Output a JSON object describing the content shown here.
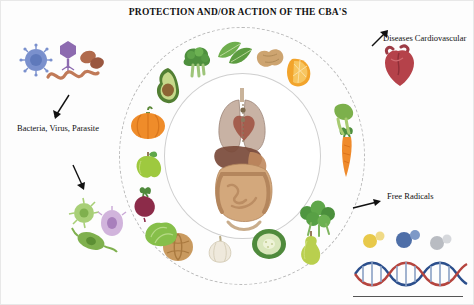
{
  "figure": {
    "title": "PROTECTION AND/OR ACTION OF THE CBA'S",
    "background_color": "#fdfdfd"
  },
  "labels": {
    "pathogens": "Bacteria, Virus, Parasite",
    "cardiovascular": "Diseases Cardiovascular",
    "free_radicals": "Free Radicals"
  },
  "rings": {
    "outer_style": "dashed-circle",
    "inner_style": "solid-circle",
    "outer_color": "#b9b9b9",
    "inner_color": "#cfcfcf"
  },
  "center": {
    "name": "human-torso-organs",
    "description": "Human torso anatomy with lungs, heart, liver, stomach and intestines"
  },
  "foods_ring": [
    {
      "name": "broccoli",
      "color": "#5f9f4a"
    },
    {
      "name": "spinach-leaves",
      "color": "#6fae4e"
    },
    {
      "name": "ginger-root",
      "color": "#cfa86b"
    },
    {
      "name": "orange-slice",
      "color": "#f0a62c"
    },
    {
      "name": "carrot",
      "color": "#ef8a2b"
    },
    {
      "name": "celery-stalk",
      "color": "#86b454"
    },
    {
      "name": "parsley-bunch",
      "color": "#5ea049"
    },
    {
      "name": "zucchini",
      "color": "#7fae53"
    },
    {
      "name": "pear",
      "color": "#b9cf5a"
    },
    {
      "name": "garlic-bulb",
      "color": "#e8e3d2"
    },
    {
      "name": "walnut",
      "color": "#c49a63"
    },
    {
      "name": "lettuce",
      "color": "#8fc05a"
    },
    {
      "name": "beetroot",
      "color": "#8e2b48"
    },
    {
      "name": "green-apple",
      "color": "#9ec93f"
    },
    {
      "name": "pumpkin",
      "color": "#ef8c2a"
    },
    {
      "name": "avocado",
      "color": "#6f9c3f"
    }
  ],
  "pathogens_group": [
    {
      "name": "virus-particle",
      "color": "#6f86c9"
    },
    {
      "name": "bacteriophage",
      "color": "#8d6bb0"
    },
    {
      "name": "spirochete-bacterium",
      "color": "#c06a4e"
    },
    {
      "name": "rod-bacterium",
      "color": "#a85a42"
    },
    {
      "name": "amoeba-parasite",
      "color": "#9ec96a"
    },
    {
      "name": "flagellate-parasite",
      "color": "#7fb04e"
    },
    {
      "name": "protozoan-cell",
      "color": "#c9a7d6"
    }
  ],
  "cardio_group": [
    {
      "name": "human-heart",
      "color": "#b5424a"
    }
  ],
  "radicals_group": [
    {
      "name": "molecule-yellow",
      "color": "#e8c94a"
    },
    {
      "name": "molecule-blue",
      "color": "#4f6fa8"
    },
    {
      "name": "molecule-grey",
      "color": "#b9bcc2"
    },
    {
      "name": "dna-double-helix",
      "color": "#2c4f8c"
    }
  ],
  "arrows": [
    {
      "name": "arrow-to-pathogens",
      "direction": "down-left"
    },
    {
      "name": "arrow-to-pathogens-lower",
      "direction": "down"
    },
    {
      "name": "arrow-to-cardiovascular",
      "direction": "up-right"
    },
    {
      "name": "arrow-to-free-radicals",
      "direction": "right"
    }
  ]
}
